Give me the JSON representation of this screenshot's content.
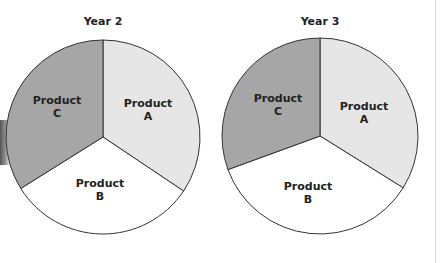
{
  "chart_data": [
    {
      "type": "pie",
      "title": "Year 2",
      "labels": [
        "Product A",
        "Product B",
        "Product C"
      ],
      "values": [
        34.4,
        31.7,
        33.9
      ],
      "colors": [
        "#e6e6e6",
        "#ffffff",
        "#a6a6a6"
      ],
      "start_angle_deg": -90,
      "direction": "clockwise"
    },
    {
      "type": "pie",
      "title": "Year 3",
      "labels": [
        "Product A",
        "Product B",
        "Product C"
      ],
      "values": [
        33.9,
        35.6,
        30.6
      ],
      "colors": [
        "#e6e6e6",
        "#ffffff",
        "#a6a6a6"
      ],
      "start_angle_deg": -90,
      "direction": "clockwise"
    }
  ],
  "charts": [
    {
      "title": "Year 2",
      "a": [
        "Product",
        "A"
      ],
      "b": [
        "Product",
        "B"
      ],
      "c": [
        "Product",
        "C"
      ]
    },
    {
      "title": "Year 3",
      "a": [
        "Product",
        "A"
      ],
      "b": [
        "Product",
        "B"
      ],
      "c": [
        "Product",
        "C"
      ]
    }
  ]
}
